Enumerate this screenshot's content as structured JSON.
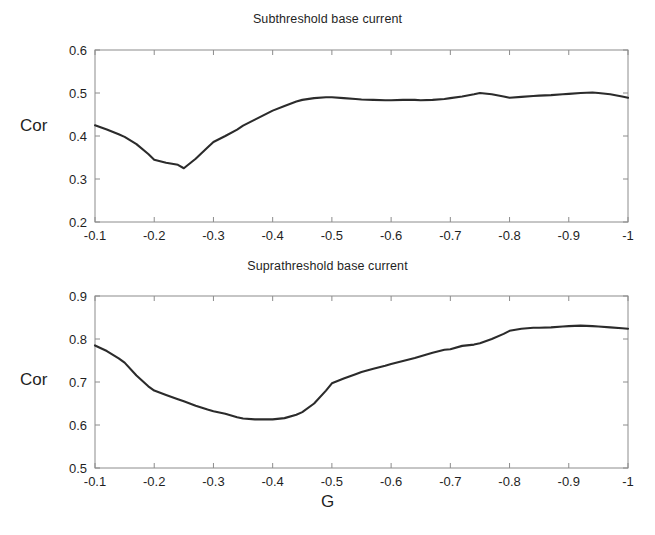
{
  "figure": {
    "background": "#ffffff",
    "line_color": "#2b2b2b",
    "axis_color": "#8c8c8c",
    "text_color": "#1f1f1f",
    "xlabel": "G"
  },
  "panels": [
    {
      "id": "subthreshold",
      "title": "Subthreshold base current",
      "ylabel": "Cor",
      "ytick_labels": [
        "0.6",
        "0.5",
        "0.4",
        "0.3",
        "0.2"
      ],
      "xtick_labels": [
        "-0.1",
        "-0.2",
        "-0.3",
        "-0.4",
        "-0.5",
        "-0.6",
        "-0.7",
        "-0.8",
        "-0.9",
        "-1"
      ]
    },
    {
      "id": "suprathreshold",
      "title": "Suprathreshold base current",
      "ylabel": "Cor",
      "ytick_labels": [
        "0.9",
        "0.8",
        "0.7",
        "0.6",
        "0.5"
      ],
      "xtick_labels": [
        "-0.1",
        "-0.2",
        "-0.3",
        "-0.4",
        "-0.5",
        "-0.6",
        "-0.7",
        "-0.8",
        "-0.9",
        "-1"
      ]
    }
  ],
  "chart_data": [
    {
      "type": "line",
      "title": "Subthreshold base current",
      "xlabel": "",
      "ylabel": "Cor",
      "xlim": [
        -0.1,
        -1.0
      ],
      "ylim": [
        0.2,
        0.6
      ],
      "xticks": [
        -0.1,
        -0.2,
        -0.3,
        -0.4,
        -0.5,
        -0.6,
        -0.7,
        -0.8,
        -0.9,
        -1.0
      ],
      "yticks": [
        0.2,
        0.3,
        0.4,
        0.5,
        0.6
      ],
      "grid": false,
      "legend": "none",
      "x": [
        -0.1,
        -0.12,
        -0.14,
        -0.15,
        -0.17,
        -0.19,
        -0.2,
        -0.22,
        -0.24,
        -0.25,
        -0.27,
        -0.29,
        -0.3,
        -0.32,
        -0.34,
        -0.35,
        -0.37,
        -0.39,
        -0.4,
        -0.42,
        -0.44,
        -0.45,
        -0.47,
        -0.49,
        -0.5,
        -0.52,
        -0.54,
        -0.55,
        -0.57,
        -0.59,
        -0.6,
        -0.62,
        -0.64,
        -0.65,
        -0.67,
        -0.69,
        -0.7,
        -0.72,
        -0.74,
        -0.75,
        -0.77,
        -0.79,
        -0.8,
        -0.82,
        -0.84,
        -0.85,
        -0.87,
        -0.89,
        -0.9,
        -0.92,
        -0.94,
        -0.95,
        -0.97,
        -0.99,
        -1.0
      ],
      "y": [
        0.425,
        0.415,
        0.404,
        0.398,
        0.381,
        0.358,
        0.345,
        0.338,
        0.333,
        0.325,
        0.347,
        0.373,
        0.386,
        0.4,
        0.415,
        0.424,
        0.438,
        0.452,
        0.459,
        0.47,
        0.48,
        0.484,
        0.488,
        0.49,
        0.49,
        0.488,
        0.486,
        0.485,
        0.484,
        0.483,
        0.483,
        0.484,
        0.484,
        0.483,
        0.484,
        0.486,
        0.488,
        0.492,
        0.497,
        0.5,
        0.497,
        0.492,
        0.489,
        0.491,
        0.493,
        0.494,
        0.495,
        0.497,
        0.498,
        0.5,
        0.501,
        0.5,
        0.497,
        0.492,
        0.489
      ]
    },
    {
      "type": "line",
      "title": "Suprathreshold base current",
      "xlabel": "G",
      "ylabel": "Cor",
      "xlim": [
        -0.1,
        -1.0
      ],
      "ylim": [
        0.5,
        0.9
      ],
      "xticks": [
        -0.1,
        -0.2,
        -0.3,
        -0.4,
        -0.5,
        -0.6,
        -0.7,
        -0.8,
        -0.9,
        -1.0
      ],
      "yticks": [
        0.5,
        0.6,
        0.7,
        0.8,
        0.9
      ],
      "grid": false,
      "legend": "none",
      "x": [
        -0.1,
        -0.12,
        -0.14,
        -0.15,
        -0.17,
        -0.19,
        -0.2,
        -0.22,
        -0.24,
        -0.25,
        -0.27,
        -0.29,
        -0.3,
        -0.32,
        -0.34,
        -0.35,
        -0.37,
        -0.39,
        -0.4,
        -0.42,
        -0.44,
        -0.45,
        -0.47,
        -0.49,
        -0.5,
        -0.52,
        -0.54,
        -0.55,
        -0.57,
        -0.59,
        -0.6,
        -0.62,
        -0.64,
        -0.65,
        -0.67,
        -0.69,
        -0.7,
        -0.72,
        -0.74,
        -0.75,
        -0.77,
        -0.79,
        -0.8,
        -0.82,
        -0.84,
        -0.85,
        -0.87,
        -0.89,
        -0.9,
        -0.92,
        -0.94,
        -0.95,
        -0.97,
        -0.99,
        -1.0
      ],
      "y": [
        0.785,
        0.772,
        0.755,
        0.745,
        0.715,
        0.69,
        0.68,
        0.67,
        0.66,
        0.655,
        0.645,
        0.636,
        0.632,
        0.626,
        0.618,
        0.615,
        0.613,
        0.613,
        0.613,
        0.616,
        0.624,
        0.63,
        0.65,
        0.68,
        0.697,
        0.708,
        0.718,
        0.723,
        0.731,
        0.738,
        0.742,
        0.749,
        0.756,
        0.76,
        0.768,
        0.775,
        0.776,
        0.784,
        0.787,
        0.79,
        0.8,
        0.812,
        0.819,
        0.824,
        0.826,
        0.826,
        0.827,
        0.829,
        0.83,
        0.831,
        0.83,
        0.829,
        0.827,
        0.825,
        0.824
      ]
    }
  ]
}
